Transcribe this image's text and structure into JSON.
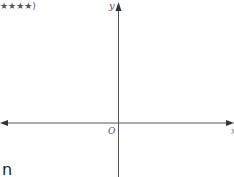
{
  "header": {
    "rating_text": "★★★★)"
  },
  "diagram": {
    "type": "cartesian-axes",
    "y_axis_label": "y",
    "x_axis_label": "x",
    "origin_label": "O",
    "axis_color": "#444444"
  },
  "footer": {
    "fragment_text": "n"
  }
}
